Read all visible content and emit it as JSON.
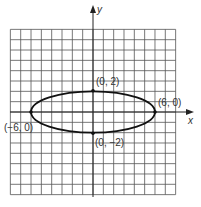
{
  "chart_data": {
    "type": "line",
    "title": "",
    "xlabel": "x",
    "ylabel": "y",
    "grid": true,
    "xlim": [
      -8,
      8
    ],
    "ylim": [
      -8,
      8
    ],
    "curve": {
      "shape": "ellipse",
      "center": [
        0,
        0
      ],
      "semi_major_x": 6,
      "semi_minor_y": 2,
      "equation": "x^2/36 + y^2/4 = 1"
    },
    "points": [
      {
        "x": 0,
        "y": 2,
        "label": "(0, 2)"
      },
      {
        "x": 6,
        "y": 0,
        "label": "(6, 0)"
      },
      {
        "x": -6,
        "y": 0,
        "label": "(−6, 0)"
      },
      {
        "x": 0,
        "y": -2,
        "label": "(0, −2)"
      }
    ]
  },
  "labels": {
    "x_axis": "x",
    "y_axis": "y",
    "top_vertex": "(0, 2)",
    "right_vertex": "(6, 0)",
    "left_vertex": "(−6, 0)",
    "bottom_vertex": "(0, −2)"
  },
  "colors": {
    "grid": "#555555",
    "axis": "#222222",
    "curve": "#111111",
    "background": "#ffffff"
  }
}
